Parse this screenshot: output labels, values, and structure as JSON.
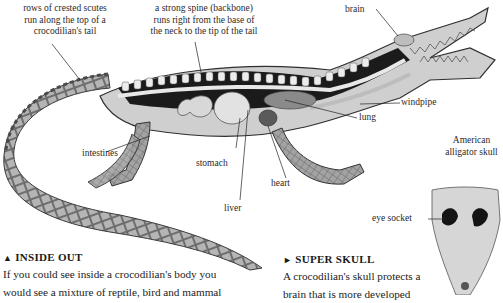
{
  "labels": {
    "scutes": [
      "rows of crested scutes",
      "run along the top of a",
      "crocodilian's tail"
    ],
    "spine": [
      "a strong spine (backbone)",
      "runs right from the base of",
      "the neck to the tip of the tail"
    ],
    "brain": "brain",
    "windpipe": "windpipe",
    "lung": "lung",
    "intestines": "intestines",
    "stomach": "stomach",
    "heart": "heart",
    "liver": "liver",
    "skull_title": [
      "American",
      "alligator skull"
    ],
    "eye_socket": "eye socket"
  },
  "captions": {
    "inside_out": {
      "marker": "▲",
      "heading": "INSIDE OUT",
      "lines": [
        "If you could see inside a crocodilian's body you",
        "would see a mixture of reptile, bird and mammal"
      ]
    },
    "super_skull": {
      "marker": "►",
      "heading": "SUPER SKULL",
      "lines": [
        "A crocodilian's skull protects a",
        "brain that is more developed"
      ]
    }
  },
  "colors": {
    "ink": "#222222",
    "skin_dark": "#6e6e6e",
    "skin_mid": "#9a9a9a",
    "skin_light": "#c8c8c8",
    "organ": "#d9d9d9",
    "cavity": "#1b1b1b"
  }
}
